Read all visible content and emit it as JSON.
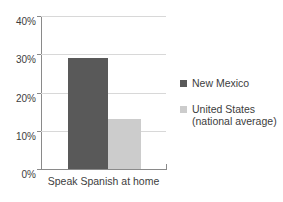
{
  "chart_data": {
    "type": "bar",
    "title": "",
    "subtitle": "",
    "xlabel": "",
    "ylabel": "",
    "categories": [
      "Speak Spanish at home"
    ],
    "series": [
      {
        "name": "New Mexico",
        "values": [
          29
        ],
        "color": "#595959"
      },
      {
        "name": "United States\n(national average)",
        "values": [
          13
        ],
        "color": "#cccccc"
      }
    ],
    "ylim": [
      0,
      40
    ],
    "ytick_values": [
      0,
      10,
      20,
      30,
      40
    ],
    "ytick_labels": [
      "0%",
      "10%",
      "20%",
      "30%",
      "40%"
    ],
    "grid": true,
    "grid_axis": "y",
    "legend_position": "right",
    "annotations": []
  },
  "axes": {
    "y_ticks": [
      {
        "label": "40%",
        "value": 40
      },
      {
        "label": "30%",
        "value": 30
      },
      {
        "label": "20%",
        "value": 20
      },
      {
        "label": "10%",
        "value": 10
      },
      {
        "label": "0%",
        "value": 0
      }
    ],
    "x_category_label": "Speak Spanish at home"
  },
  "legend": {
    "items": [
      {
        "label": "New Mexico",
        "swatch": "legend-swatch-new-mexico"
      },
      {
        "label": "United States\n(national average)",
        "swatch": "legend-swatch-united-states"
      }
    ]
  },
  "colors": {
    "series_new_mexico": "#595959",
    "series_united_states": "#cccccc",
    "gridline": "#d8d8d8",
    "axis": "#8a8a8a",
    "text": "#3d3d3d",
    "background": "#ffffff"
  }
}
